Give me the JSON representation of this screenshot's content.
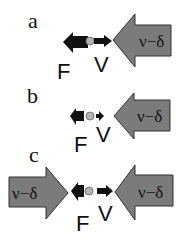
{
  "figure": {
    "panels": [
      {
        "label": "a",
        "big_arrows": [
          {
            "label": "ν−δ",
            "direction": "left"
          }
        ],
        "force_label": "F",
        "velocity_label": "V",
        "force_size": "large",
        "velocity_size": "medium"
      },
      {
        "label": "b",
        "big_arrows": [
          {
            "label": "ν−δ",
            "direction": "left"
          }
        ],
        "force_label": "F",
        "velocity_label": "V",
        "force_size": "small",
        "velocity_size": "small"
      },
      {
        "label": "c",
        "big_arrows": [
          {
            "label": "ν−δ",
            "direction": "right"
          },
          {
            "label": "ν−δ",
            "direction": "left"
          }
        ],
        "force_label": "F",
        "velocity_label": "V",
        "force_size": "small",
        "velocity_size": "medium"
      }
    ],
    "colors": {
      "big_arrow_fill": "#7b7b7b",
      "big_arrow_stroke": "#333333",
      "small_arrow_fill": "#111111",
      "particle_fill": "#b3b3b3"
    }
  }
}
